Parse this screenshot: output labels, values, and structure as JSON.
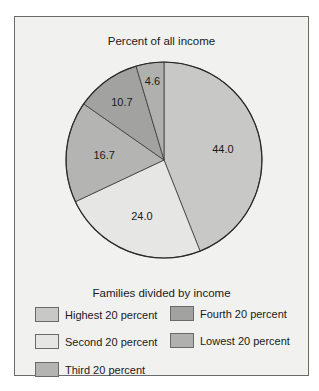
{
  "chart_data": {
    "type": "pie",
    "title": "Percent of all income",
    "legend_title": "Families divided by income",
    "legend_position": "bottom",
    "categories": [
      "Highest 20 percent",
      "Second 20 percent",
      "Third 20 percent",
      "Fourth 20 percent",
      "Lowest 20 percent"
    ],
    "values": [
      44.0,
      24.0,
      16.7,
      10.7,
      4.6
    ],
    "labels": [
      "44.0",
      "24.0",
      "16.7",
      "10.7",
      "4.6"
    ],
    "colors": [
      "#c8c8c6",
      "#e6e6e4",
      "#b4b4b2",
      "#a2a2a0",
      "#b0b0ae"
    ]
  },
  "legend": {
    "items": [
      {
        "label": "Highest 20 percent",
        "color": "#c8c8c6"
      },
      {
        "label": "Second 20 percent",
        "color": "#e6e6e4"
      },
      {
        "label": "Third 20 percent",
        "color": "#b4b4b2"
      },
      {
        "label": "Fourth 20 percent",
        "color": "#a2a2a0"
      },
      {
        "label": "Lowest 20 percent",
        "color": "#b0b0ae"
      }
    ]
  }
}
